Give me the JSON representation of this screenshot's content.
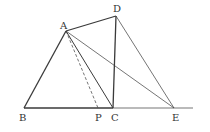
{
  "diagram": {
    "type": "geometry",
    "points": {
      "A": {
        "x": 66,
        "y": 31,
        "label": "A",
        "lx": 60,
        "ly": 29
      },
      "D": {
        "x": 116,
        "y": 16,
        "label": "D",
        "lx": 113,
        "ly": 12
      },
      "B": {
        "x": 24,
        "y": 108,
        "label": "B",
        "lx": 19,
        "ly": 121
      },
      "P": {
        "x": 98,
        "y": 108,
        "label": "P",
        "lx": 95,
        "ly": 121
      },
      "C": {
        "x": 113,
        "y": 108,
        "label": "C",
        "lx": 111,
        "ly": 121
      },
      "E": {
        "x": 174,
        "y": 108,
        "label": "E",
        "lx": 172,
        "ly": 121
      }
    },
    "segments": [
      {
        "from": "B",
        "to": "A",
        "style": "solid",
        "weight": "bold"
      },
      {
        "from": "A",
        "to": "D",
        "style": "solid",
        "weight": "bold"
      },
      {
        "from": "D",
        "to": "C",
        "style": "solid",
        "weight": "bold"
      },
      {
        "from": "B",
        "to": "C",
        "style": "solid",
        "weight": "bold"
      },
      {
        "from": "A",
        "to": "C",
        "style": "solid",
        "weight": "normal"
      },
      {
        "from": "A",
        "to": "E",
        "style": "solid",
        "weight": "thin"
      },
      {
        "from": "D",
        "to": "E",
        "style": "solid",
        "weight": "thin"
      },
      {
        "from": "A",
        "to": "P",
        "style": "dashed",
        "weight": "thin"
      },
      {
        "from": "C",
        "to": "ray-end",
        "style": "solid",
        "weight": "thin"
      }
    ],
    "ray_end": {
      "x": 193,
      "y": 108
    },
    "colors": {
      "stroke": "#3a3a3a",
      "label": "#333333",
      "background": "#ffffff"
    }
  }
}
